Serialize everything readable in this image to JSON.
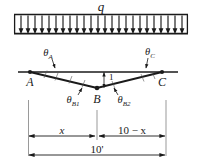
{
  "figure": {
    "title_label": "q",
    "load": {
      "symbol": "q",
      "type": "uniformly-distributed-load",
      "direction": "downward",
      "arrow_count": 24,
      "bar_left_px": 14,
      "bar_right_px": 188,
      "bar_top_px": 14,
      "arrow_tip_px": 33
    },
    "nodes": [
      {
        "id": "A",
        "label": "A",
        "x_px": 30,
        "y_px": 72
      },
      {
        "id": "B",
        "label": "B",
        "x_px": 97,
        "y_px": 88
      },
      {
        "id": "C",
        "label": "C",
        "x_px": 162,
        "y_px": 72
      }
    ],
    "angles": [
      {
        "id": "theta_A",
        "base": "θ",
        "sub": "A",
        "label": "θA"
      },
      {
        "id": "theta_B1",
        "base": "θ",
        "sub": "B1",
        "label": "θB1"
      },
      {
        "id": "theta_B2",
        "base": "θ",
        "sub": "B2",
        "label": "θB2"
      },
      {
        "id": "theta_C",
        "base": "θ",
        "sub": "C",
        "label": "θC"
      }
    ],
    "settlement": {
      "label": "1",
      "description": "vertical-settlement-at-B"
    },
    "dimensions": [
      {
        "id": "dim-x",
        "label": "x",
        "from": "A",
        "to": "B"
      },
      {
        "id": "dim-10-minus-x",
        "label": "10 − x",
        "from": "B",
        "to": "C"
      },
      {
        "id": "dim-total",
        "label": "10'",
        "from": "A",
        "to": "C"
      }
    ],
    "colors": {
      "ink": "#1a1a1a",
      "thin_ink": "#555555",
      "background": "#ffffff"
    }
  }
}
